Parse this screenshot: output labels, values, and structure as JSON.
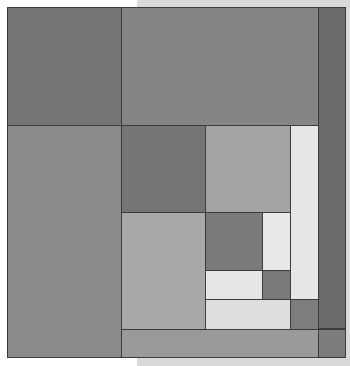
{
  "artwork": {
    "description": "Grayscale composition of nested rectangles arranged in a spiral tiling",
    "colors": {
      "background_left": "#ffffff",
      "background_right": "#dadada",
      "line": "#3c3c3c"
    },
    "tiles": [
      {
        "id": "top-left",
        "x": 7,
        "y": 7,
        "w": 115,
        "h": 119,
        "color": "#757575"
      },
      {
        "id": "top-right",
        "x": 121,
        "y": 7,
        "w": 198,
        "h": 119,
        "color": "#858585"
      },
      {
        "id": "right-column",
        "x": 318,
        "y": 7,
        "w": 28,
        "h": 322,
        "color": "#6a6a6a"
      },
      {
        "id": "left-column",
        "x": 7,
        "y": 125,
        "w": 115,
        "h": 233,
        "color": "#8a8a8a"
      },
      {
        "id": "inner-dark-1",
        "x": 121,
        "y": 125,
        "w": 85,
        "h": 88,
        "color": "#757575"
      },
      {
        "id": "inner-mid-1",
        "x": 205,
        "y": 125,
        "w": 86,
        "h": 88,
        "color": "#a4a4a4"
      },
      {
        "id": "inner-light-1",
        "x": 290,
        "y": 125,
        "w": 29,
        "h": 175,
        "color": "#e6e6e6"
      },
      {
        "id": "inner-mid-2",
        "x": 121,
        "y": 212,
        "w": 85,
        "h": 118,
        "color": "#a8a8a8"
      },
      {
        "id": "inner-dark-2",
        "x": 205,
        "y": 212,
        "w": 58,
        "h": 59,
        "color": "#7a7a7a"
      },
      {
        "id": "inner-light-2",
        "x": 262,
        "y": 212,
        "w": 29,
        "h": 59,
        "color": "#e8e8e8"
      },
      {
        "id": "inner-light-3",
        "x": 205,
        "y": 270,
        "w": 58,
        "h": 30,
        "color": "#e6e6e6"
      },
      {
        "id": "inner-dark-3",
        "x": 262,
        "y": 270,
        "w": 29,
        "h": 30,
        "color": "#7a7a7a"
      },
      {
        "id": "inner-light-4",
        "x": 205,
        "y": 299,
        "w": 86,
        "h": 31,
        "color": "#dedede"
      },
      {
        "id": "inner-dark-4",
        "x": 290,
        "y": 299,
        "w": 29,
        "h": 31,
        "color": "#7d7d7d"
      },
      {
        "id": "bottom-strip",
        "x": 121,
        "y": 329,
        "w": 198,
        "h": 29,
        "color": "#9a9a9a"
      },
      {
        "id": "bottom-corner",
        "x": 318,
        "y": 329,
        "w": 28,
        "h": 29,
        "color": "#7c7c7c"
      }
    ]
  }
}
